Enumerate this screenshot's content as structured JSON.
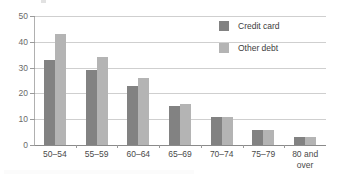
{
  "chart_data": {
    "type": "bar",
    "title": "",
    "subtitle": "",
    "xlabel": "",
    "ylabel": "",
    "categories": [
      "50–54",
      "55–59",
      "60–64",
      "65–69",
      "70–74",
      "75–79",
      "80 and\nover"
    ],
    "series": [
      {
        "name": "Credit card",
        "color": "#828282",
        "values": [
          33,
          29,
          23,
          15,
          11,
          6,
          3
        ]
      },
      {
        "name": "Other debt",
        "color": "#b4b4b4",
        "values": [
          43,
          34,
          26,
          16,
          11,
          6,
          3
        ]
      }
    ],
    "ylim": [
      0,
      50
    ],
    "yticks": [
      0,
      10,
      20,
      30,
      40,
      50
    ],
    "ytick_labels": [
      "0",
      "10",
      "20",
      "30",
      "40",
      "50"
    ],
    "grid": true,
    "grid_axis": "y",
    "legend_position": "top-right"
  },
  "legend": {
    "items": [
      {
        "label": "Credit card",
        "swatch": "legend-swatch-credit-card"
      },
      {
        "label": "Other debt",
        "swatch": "legend-swatch-other-debt"
      }
    ]
  },
  "axes": {
    "y": {
      "labels": [
        "50",
        "40",
        "30",
        "20",
        "10",
        "0"
      ]
    },
    "x": {
      "labels": [
        "50–54",
        "55–59",
        "60–64",
        "65–69",
        "70–74",
        "80 and over"
      ]
    }
  }
}
